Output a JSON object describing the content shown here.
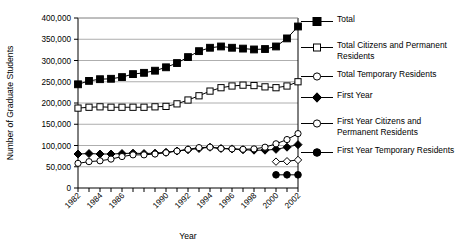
{
  "chart_data": {
    "type": "line",
    "title": "",
    "xlabel": "Year",
    "ylabel": "Number of Graduate Students",
    "x": [
      1982,
      1983,
      1984,
      1985,
      1986,
      1987,
      1988,
      1989,
      1990,
      1991,
      1992,
      1993,
      1994,
      1995,
      1996,
      1997,
      1998,
      1999,
      2000,
      2001,
      2002
    ],
    "xlim": [
      1982,
      2002
    ],
    "ylim": [
      0,
      400000
    ],
    "yticks": [
      0,
      50000,
      100000,
      150000,
      200000,
      250000,
      300000,
      350000,
      400000
    ],
    "ytick_labels": [
      "0",
      "50,000",
      "100,000",
      "150,000",
      "200,000",
      "250,000",
      "300,000",
      "350,000",
      "400,000"
    ],
    "xtick_labels": [
      "1982",
      "1984",
      "1986",
      "1990",
      "1992",
      "1994",
      "1996",
      "1998",
      "2000",
      "2002"
    ],
    "xtick_label_years": [
      1982,
      1984,
      1986,
      1990,
      1992,
      1994,
      1996,
      1998,
      2000,
      2002
    ],
    "xtick_rotation": 45,
    "grid": "horizontal",
    "legend_position": "right",
    "series": [
      {
        "name": "Total",
        "marker": "filled-square",
        "color": "#000000",
        "values": [
          244000,
          252000,
          256000,
          257000,
          261000,
          268000,
          271000,
          276000,
          284000,
          294000,
          308000,
          322000,
          330000,
          333000,
          330000,
          328000,
          326000,
          327000,
          333000,
          352000,
          380000
        ]
      },
      {
        "name": "Total Citizens and Permanent Residents",
        "marker": "open-square",
        "color": "#000000",
        "values": [
          188000,
          190000,
          191000,
          190000,
          190000,
          190000,
          190000,
          191000,
          192000,
          198000,
          207000,
          217000,
          228000,
          236000,
          240000,
          242000,
          241000,
          238000,
          236000,
          240000,
          250000
        ]
      },
      {
        "name": "Total Temporary Residents",
        "marker": "open-circle",
        "color": "#000000",
        "values": [
          null,
          null,
          null,
          null,
          null,
          null,
          null,
          null,
          null,
          null,
          null,
          null,
          null,
          null,
          null,
          null,
          null,
          null,
          null,
          null,
          null
        ]
      },
      {
        "name": "First Year",
        "marker": "filled-diamond",
        "color": "#000000",
        "values": [
          80000,
          81000,
          80000,
          80000,
          81000,
          82000,
          81000,
          82000,
          84000,
          87000,
          90000,
          93000,
          96000,
          93000,
          92000,
          90000,
          89000,
          89000,
          91000,
          96000,
          102000
        ]
      },
      {
        "name": "First Year Citizens and Permanent Residents",
        "marker": "open-circle",
        "color": "#000000",
        "values": [
          58000,
          62000,
          64000,
          68000,
          74000,
          78000,
          78000,
          80000,
          83000,
          87000,
          91000,
          95000,
          96000,
          93000,
          92000,
          91000,
          92000,
          96000,
          104000,
          114000,
          128000
        ]
      },
      {
        "name": "First Year Temporary Residents",
        "marker": "filled-circle",
        "color": "#000000",
        "values": [
          null,
          null,
          null,
          null,
          null,
          null,
          null,
          null,
          null,
          null,
          null,
          null,
          null,
          null,
          null,
          null,
          null,
          null,
          31000,
          31000,
          31000
        ]
      },
      {
        "name": "First Year Citizens Partial",
        "marker": "open-diamond",
        "color": "#000000",
        "values": [
          null,
          null,
          null,
          null,
          null,
          null,
          null,
          null,
          null,
          null,
          null,
          null,
          null,
          null,
          null,
          null,
          null,
          null,
          62000,
          63000,
          66000
        ]
      }
    ]
  },
  "legend": {
    "entries": [
      {
        "label": "Total",
        "marker": "filled-square"
      },
      {
        "label": "Total Citizens and Permanent Residents",
        "marker": "open-square"
      },
      {
        "label": "Total Temporary Residents",
        "marker": "open-circle"
      },
      {
        "label": "First Year",
        "marker": "filled-diamond"
      },
      {
        "label": "First Year Citizens and Permanent Residents",
        "marker": "open-circle"
      },
      {
        "label": "First Year Temporary Residents",
        "marker": "filled-circle"
      }
    ]
  }
}
